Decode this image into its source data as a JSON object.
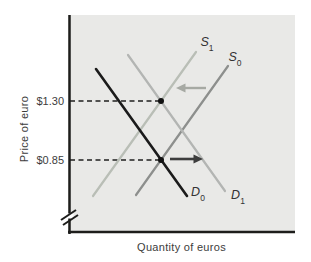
{
  "chart_data": {
    "type": "line",
    "title": "",
    "xlabel": "Quantity of euros",
    "ylabel": "Price of euro",
    "x_axis_numeric": false,
    "grid": false,
    "y_ticks": [
      {
        "label": "$1.30",
        "value": 1.3,
        "y": 101
      },
      {
        "label": "$0.85",
        "value": 0.85,
        "y": 160
      }
    ],
    "curves": [
      {
        "name": "S1",
        "base": "S",
        "sub": "1",
        "color": "#b9beb6",
        "width": 2.2,
        "x1": 93,
        "y1": 196,
        "x2": 196,
        "y2": 52,
        "label_x": 207,
        "label_y": 43
      },
      {
        "name": "S0",
        "base": "S",
        "sub": "0",
        "color": "#8d8f8d",
        "width": 2.2,
        "x1": 136,
        "y1": 195,
        "x2": 228,
        "y2": 66,
        "label_x": 235,
        "label_y": 58
      },
      {
        "name": "D0",
        "base": "D",
        "sub": "0",
        "color": "#1b1b1b",
        "width": 2.6,
        "x1": 96,
        "y1": 69,
        "x2": 187,
        "y2": 196,
        "label_x": 198,
        "label_y": 193
      },
      {
        "name": "D1",
        "base": "D",
        "sub": "1",
        "color": "#b3b5b3",
        "width": 2.2,
        "x1": 128,
        "y1": 55,
        "x2": 225,
        "y2": 191,
        "label_x": 238,
        "label_y": 196
      }
    ],
    "equilibrium_points": [
      {
        "x": 161,
        "y": 101,
        "price_label": "$1.30"
      },
      {
        "x": 161,
        "y": 160,
        "price_label": "$0.85"
      }
    ],
    "guides": [
      {
        "y": 101,
        "x_end": 160
      },
      {
        "y": 160,
        "x_end": 160
      }
    ],
    "arrows": [
      {
        "direction": "left",
        "color": "#a6a9a3",
        "width": 2.4,
        "x1": 206,
        "y1": 88,
        "x2": 184,
        "y2": 88,
        "head": "176,88 185.5,83.6 185.5,92.4"
      },
      {
        "direction": "right",
        "color": "#3d3d3d",
        "width": 2.6,
        "x1": 170,
        "y1": 159,
        "x2": 195,
        "y2": 159,
        "head": "203,159 193.5,154.6 193.5,163.4"
      }
    ],
    "plot_area": {
      "x": 68,
      "y": 15,
      "w": 227,
      "h": 218,
      "bg": "#e9e9e7"
    },
    "axis": {
      "color": "#1d1d1b",
      "width": 2.5,
      "break": {
        "gap_y": 213.5,
        "gap_h": 5,
        "slash1": "61,220 76,210",
        "slash2": "63,225 78,215"
      }
    },
    "style": {
      "dash_color": "#1f1f1f",
      "dash_width": 1.4,
      "dash_array": "5 3.5",
      "point_color": "#111111",
      "point_r": 3
    }
  }
}
